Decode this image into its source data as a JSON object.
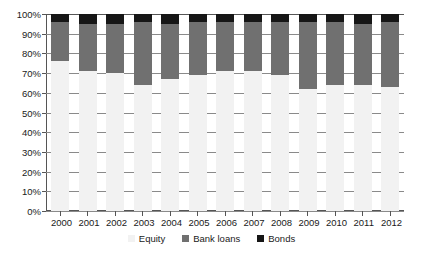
{
  "chart_data": {
    "type": "bar",
    "subtype": "stacked-percentage-column",
    "title": "",
    "subtitle": "",
    "xlabel": "",
    "ylabel": "",
    "ylim": [
      0,
      100
    ],
    "yunit": "%",
    "grid": true,
    "legend_position": "bottom",
    "categories": [
      "2000",
      "2001",
      "2002",
      "2003",
      "2004",
      "2005",
      "2006",
      "2007",
      "2008",
      "2009",
      "2010",
      "2011",
      "2012"
    ],
    "ytick_labels": [
      "100%",
      "90%",
      "80%",
      "70%",
      "60%",
      "50%",
      "40%",
      "30%",
      "20%",
      "10%",
      "0%"
    ],
    "ytick_values": [
      100,
      90,
      80,
      70,
      60,
      50,
      40,
      30,
      20,
      10,
      0
    ],
    "series": [
      {
        "name": "Equity",
        "color": "#f2f2f2",
        "values": [
          76,
          71,
          70,
          64,
          67,
          69,
          71,
          71,
          69,
          62,
          64,
          64,
          63
        ]
      },
      {
        "name": "Bank  loans",
        "color": "#707070",
        "values": [
          20,
          24,
          25,
          32,
          28,
          27,
          25,
          25,
          27,
          34,
          32,
          31,
          33
        ]
      },
      {
        "name": "Bonds",
        "color": "#161616",
        "values": [
          4,
          5,
          5,
          4,
          5,
          4,
          4,
          4,
          4,
          4,
          4,
          5,
          4
        ]
      }
    ],
    "legend": [
      {
        "label": "Equity",
        "color": "#f2f2f2"
      },
      {
        "label": "Bank  loans",
        "color": "#707070"
      },
      {
        "label": "Bonds",
        "color": "#161616"
      }
    ]
  }
}
